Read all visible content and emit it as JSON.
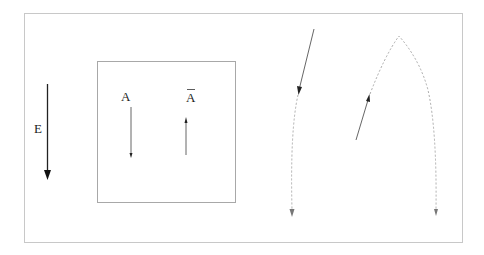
{
  "diagram": {
    "labels": {
      "field": "E",
      "particle": "A",
      "antiparticle": "A"
    },
    "colors": {
      "frame": "#c8c8c8",
      "solid_arrow": "#333333",
      "dashed_path": "#999999"
    }
  }
}
